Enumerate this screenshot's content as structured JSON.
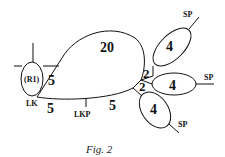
{
  "figure": {
    "caption": "Fig. 2",
    "ring_label": "(R1)",
    "loops": {
      "big_loop_weight": "20",
      "diagonal_edge_weight": "5",
      "bottom_edge_weight_left": "5",
      "bottom_edge_weight_right": "5"
    },
    "junction_weights": [
      "2",
      "2"
    ],
    "side_loops": [
      {
        "weight": "4",
        "endpoint_label": "SP"
      },
      {
        "weight": "4",
        "endpoint_label": "SP"
      },
      {
        "weight": "4",
        "endpoint_label": "SP"
      }
    ],
    "node_labels": {
      "lk": "LK",
      "lkp": "LKP"
    }
  }
}
